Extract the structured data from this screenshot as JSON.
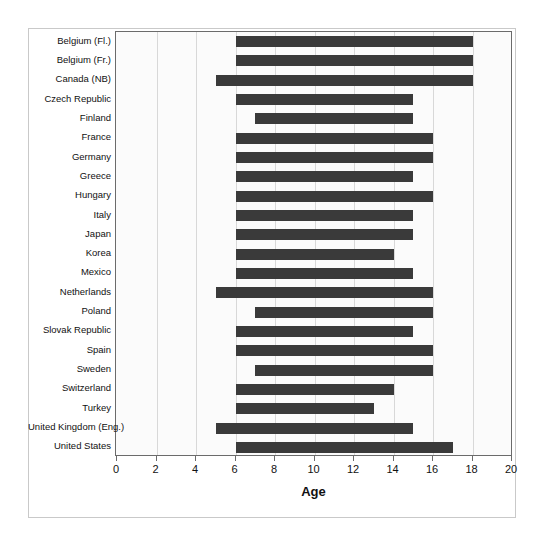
{
  "chart_data": {
    "type": "bar",
    "orientation": "horizontal",
    "title": "",
    "xlabel": "Age",
    "ylabel": "",
    "xlim": [
      0,
      20
    ],
    "ylim": null,
    "grid": true,
    "legend": null,
    "xticks": [
      0,
      2,
      4,
      6,
      8,
      10,
      12,
      14,
      16,
      18,
      20
    ],
    "xtick_labels": [
      "0",
      "2",
      "4",
      "6",
      "8",
      "10",
      "12",
      "14",
      "16",
      "18",
      "20"
    ],
    "bar_color": "#3a3a3a",
    "categories": [
      "Belgium (Fl.)",
      "Belgium (Fr.)",
      "Canada (NB)",
      "Czech Republic",
      "Finland",
      "France",
      "Germany",
      "Greece",
      "Hungary",
      "Italy",
      "Japan",
      "Korea",
      "Mexico",
      "Netherlands",
      "Poland",
      "Slovak Republic",
      "Spain",
      "Sweden",
      "Switzerland",
      "Turkey",
      "United Kingdom (Eng.)",
      "United States"
    ],
    "ranges": [
      {
        "category": "Belgium (Fl.)",
        "start": 6,
        "end": 18
      },
      {
        "category": "Belgium (Fr.)",
        "start": 6,
        "end": 18
      },
      {
        "category": "Canada (NB)",
        "start": 5,
        "end": 18
      },
      {
        "category": "Czech Republic",
        "start": 6,
        "end": 15
      },
      {
        "category": "Finland",
        "start": 7,
        "end": 15
      },
      {
        "category": "France",
        "start": 6,
        "end": 16
      },
      {
        "category": "Germany",
        "start": 6,
        "end": 16
      },
      {
        "category": "Greece",
        "start": 6,
        "end": 15
      },
      {
        "category": "Hungary",
        "start": 6,
        "end": 16
      },
      {
        "category": "Italy",
        "start": 6,
        "end": 15
      },
      {
        "category": "Japan",
        "start": 6,
        "end": 15
      },
      {
        "category": "Korea",
        "start": 6,
        "end": 14
      },
      {
        "category": "Mexico",
        "start": 6,
        "end": 15
      },
      {
        "category": "Netherlands",
        "start": 5,
        "end": 16
      },
      {
        "category": "Poland",
        "start": 7,
        "end": 16
      },
      {
        "category": "Slovak Republic",
        "start": 6,
        "end": 15
      },
      {
        "category": "Spain",
        "start": 6,
        "end": 16
      },
      {
        "category": "Sweden",
        "start": 7,
        "end": 16
      },
      {
        "category": "Switzerland",
        "start": 6,
        "end": 14
      },
      {
        "category": "Turkey",
        "start": 6,
        "end": 13
      },
      {
        "category": "United Kingdom (Eng.)",
        "start": 5,
        "end": 15
      },
      {
        "category": "United States",
        "start": 6,
        "end": 17
      }
    ]
  }
}
